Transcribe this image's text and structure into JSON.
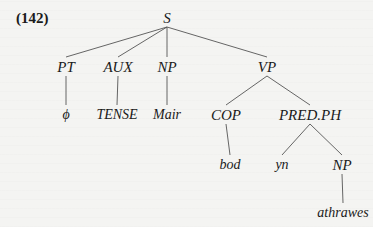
{
  "example_number": "(142)",
  "nodes": {
    "S": {
      "label": "S",
      "x": 167,
      "y": 18
    },
    "PT": {
      "label": "PT",
      "x": 66,
      "y": 67
    },
    "AUX": {
      "label": "AUX",
      "x": 118,
      "y": 67
    },
    "NP1": {
      "label": "NP",
      "x": 167,
      "y": 67
    },
    "VP": {
      "label": "VP",
      "x": 267,
      "y": 67
    },
    "phi": {
      "label": "ϕ",
      "x": 66,
      "y": 115
    },
    "TENSE": {
      "label": "TENSE",
      "x": 117,
      "y": 115
    },
    "Mair": {
      "label": "Mair",
      "x": 167,
      "y": 115
    },
    "COP": {
      "label": "COP",
      "x": 226,
      "y": 115
    },
    "PREDPH": {
      "label": "PRED.PH",
      "x": 310,
      "y": 115
    },
    "bod": {
      "label": "bod",
      "x": 230,
      "y": 165
    },
    "yn": {
      "label": "yn",
      "x": 282,
      "y": 165
    },
    "NP2": {
      "label": "NP",
      "x": 342,
      "y": 165
    },
    "athrawes": {
      "label": "athrawes",
      "x": 343,
      "y": 213
    }
  },
  "edges": [
    [
      "S",
      "PT"
    ],
    [
      "S",
      "AUX"
    ],
    [
      "S",
      "NP1"
    ],
    [
      "S",
      "VP"
    ],
    [
      "PT",
      "phi"
    ],
    [
      "AUX",
      "TENSE"
    ],
    [
      "NP1",
      "Mair"
    ],
    [
      "VP",
      "COP"
    ],
    [
      "VP",
      "PREDPH"
    ],
    [
      "COP",
      "bod"
    ],
    [
      "PREDPH",
      "yn"
    ],
    [
      "PREDPH",
      "NP2"
    ],
    [
      "NP2",
      "athrawes"
    ]
  ],
  "colors": {
    "line": "#555555",
    "text": "#1a1a1a",
    "background": "#f4f4f2"
  }
}
